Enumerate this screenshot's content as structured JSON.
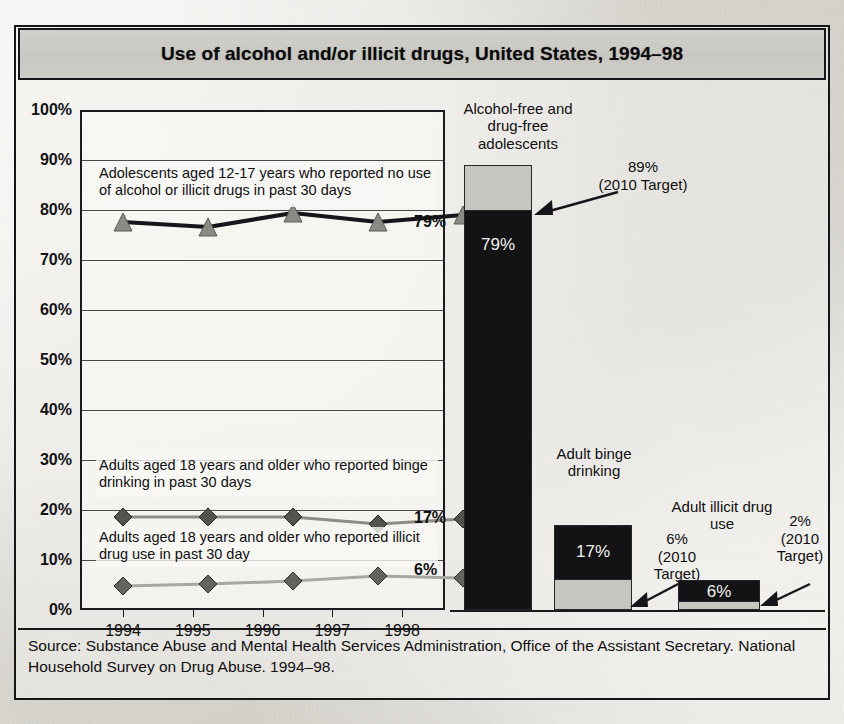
{
  "title": "Use of alcohol and/or illicit drugs, United States, 1994–98",
  "source": "Source:  Substance Abuse and Mental Health Services Administration, Office of the Assistant Secretary. National Household Survey on Drug Abuse. 1994–98.",
  "axis": {
    "y_ticks": [
      "100%",
      "90%",
      "80%",
      "70%",
      "60%",
      "50%",
      "40%",
      "30%",
      "20%",
      "10%",
      "0%"
    ],
    "x_ticks": [
      "1994",
      "1995",
      "1996",
      "1997",
      "1998"
    ]
  },
  "annotations": {
    "adolescent": "Adolescents aged 12-17 years who reported no use of alcohol or illicit drugs in past 30 days",
    "binge": "Adults aged 18 years and older who reported binge drinking in past 30 days",
    "illicit": "Adults aged 18 years and older who reported illicit drug use in past 30 day"
  },
  "end_labels": {
    "adolescent": "79%",
    "binge": "17%",
    "illicit": "6%"
  },
  "bars": {
    "adolescent": {
      "caption": "Alcohol-free and drug-free adolescents",
      "value_label": "79%",
      "target_label": "89%\n(2010 Target)",
      "target_line1": "89%",
      "target_line2": "(2010 Target)"
    },
    "binge": {
      "caption": "Adult binge drinking",
      "value_label": "17%",
      "target_line1": "6%",
      "target_line2": "(2010",
      "target_line3": "Target)"
    },
    "illicit": {
      "caption": "Adult illicit drug use",
      "value_label": "6%",
      "target_line1": "2%",
      "target_line2": "(2010",
      "target_line3": "Target)"
    }
  },
  "colors": {
    "ink": "#131316",
    "bar_value": "#131316",
    "bar_target": "#c7c5c0",
    "title_fill": "#cecbc6",
    "paper": "#e9e7e2"
  },
  "chart_data": {
    "type": "line",
    "title": "Use of alcohol and/or illicit drugs, United States, 1994–98",
    "xlabel": "",
    "ylabel": "",
    "ylim": [
      0,
      100
    ],
    "grid": true,
    "legend": "inline-annotations",
    "categories": [
      "1994",
      "1995",
      "1996",
      "1997",
      "1998"
    ],
    "series": [
      {
        "name": "Adolescents aged 12-17 years who reported no use of alcohol or illicit drugs in past 30 days",
        "values": [
          78,
          77,
          79.5,
          78,
          79
        ],
        "marker": "triangle",
        "end_label": "79%"
      },
      {
        "name": "Adults aged 18 years and older who reported binge drinking in past 30 days",
        "values": [
          19,
          19,
          19,
          17.5,
          18.5
        ],
        "marker": "diamond",
        "end_label": "17%"
      },
      {
        "name": "Adults aged 18 years and older who reported illicit drug use in past 30 day",
        "values": [
          5,
          5.2,
          5.6,
          6.5,
          6.3
        ],
        "marker": "diamond",
        "end_label": "6%"
      }
    ],
    "companion_bars": {
      "type": "bar",
      "note": "Current value vs 2010 Target, stacked column markers",
      "items": [
        {
          "label": "Alcohol-free and drug-free adolescents",
          "value": 79,
          "target": 89
        },
        {
          "label": "Adult binge drinking",
          "value": 17,
          "target": 6
        },
        {
          "label": "Adult illicit drug use",
          "value": 6,
          "target": 2
        }
      ]
    }
  }
}
